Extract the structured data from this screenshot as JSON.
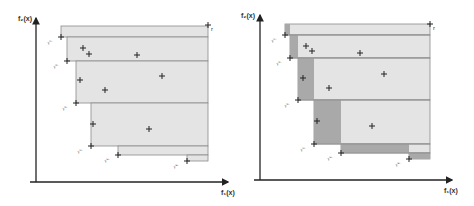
{
  "panels": [
    {
      "id": "left",
      "y_axis_label": "f₂(x)",
      "x_axis_label": "f₁(x)",
      "reference_point_label": "r",
      "nondominated_labels": [
        "y⁽¹⁾",
        "y⁽²⁾",
        "y⁽³⁾",
        "y⁽⁴⁾",
        "y⁽⁵⁾",
        "y⁽⁶⁾"
      ]
    },
    {
      "id": "right",
      "y_axis_label": "f₂(x)",
      "x_axis_label": "f₁(x)",
      "reference_point_label": "r",
      "nondominated_labels": [
        "y⁽¹⁾",
        "y⁽²⁾",
        "y⁽³⁾",
        "y⁽⁴⁾",
        "y⁽⁵⁾",
        "y⁽⁶⁾"
      ]
    }
  ],
  "colors": {
    "axis": "#222222",
    "region_light": "#e4e4e4",
    "region_dark": "#a9a9a9",
    "band_line": "#8a8a8a",
    "marker": "#222222"
  }
}
